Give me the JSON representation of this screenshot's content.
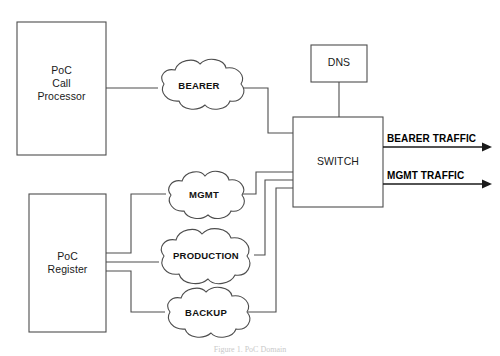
{
  "diagram": {
    "caption": "Figure 1. PoC Domain",
    "background_color": "#ffffff",
    "line_color": "#4d4d4d",
    "arrow_color": "#1a1a1a",
    "nodes": [
      {
        "id": "poc-call-processor",
        "type": "box",
        "label": "PoC\nCall\nProcessor",
        "x": 17,
        "y": 22,
        "w": 89,
        "h": 133
      },
      {
        "id": "poc-register",
        "type": "box",
        "label": "PoC\nRegister",
        "x": 29,
        "y": 194,
        "w": 77,
        "h": 138
      },
      {
        "id": "dns",
        "type": "box",
        "label": "DNS",
        "x": 311,
        "y": 45,
        "w": 56,
        "h": 37
      },
      {
        "id": "switch",
        "type": "box",
        "label": "SWITCH",
        "x": 293,
        "y": 117,
        "w": 90,
        "h": 90
      },
      {
        "id": "bearer",
        "type": "cloud",
        "label": "BEARER",
        "cx": 199,
        "cy": 85,
        "rx": 45,
        "ry": 25
      },
      {
        "id": "mgmt",
        "type": "cloud",
        "label": "MGMT",
        "cx": 204,
        "cy": 194,
        "rx": 41,
        "ry": 24
      },
      {
        "id": "production",
        "type": "cloud",
        "label": "PRODUCTION",
        "cx": 206,
        "cy": 255,
        "rx": 50,
        "ry": 26
      },
      {
        "id": "backup",
        "type": "cloud",
        "label": "BACKUP",
        "cx": 206,
        "cy": 312,
        "rx": 44,
        "ry": 25
      }
    ],
    "outputs": [
      {
        "id": "bearer-traffic",
        "label": "BEARER TRAFFIC",
        "y": 147
      },
      {
        "id": "mgmt-traffic",
        "label": "MGMT TRAFFIC",
        "y": 184
      }
    ],
    "links": [
      {
        "from": "poc-call-processor",
        "to": "bearer"
      },
      {
        "from": "bearer",
        "to": "switch"
      },
      {
        "from": "dns",
        "to": "switch"
      },
      {
        "from": "poc-register",
        "to": "mgmt"
      },
      {
        "from": "poc-register",
        "to": "production"
      },
      {
        "from": "poc-register",
        "to": "backup"
      },
      {
        "from": "mgmt",
        "to": "switch"
      },
      {
        "from": "production",
        "to": "switch"
      },
      {
        "from": "backup",
        "to": "switch"
      }
    ]
  }
}
